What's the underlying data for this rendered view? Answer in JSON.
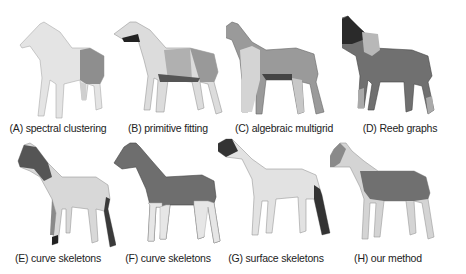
{
  "figure": {
    "panels": [
      {
        "id": "A",
        "caption": "(A) spectral clustering"
      },
      {
        "id": "B",
        "caption": "(B) primitive fitting"
      },
      {
        "id": "C",
        "caption": "(C) algebraic multigrid"
      },
      {
        "id": "D",
        "caption": "(D) Reeb graphs"
      },
      {
        "id": "E",
        "caption": "(E) curve skeletons"
      },
      {
        "id": "F",
        "caption": "(F) curve skeletons"
      },
      {
        "id": "G",
        "caption": "(G) surface skeletons"
      },
      {
        "id": "H",
        "caption": "(H) our method"
      }
    ]
  }
}
